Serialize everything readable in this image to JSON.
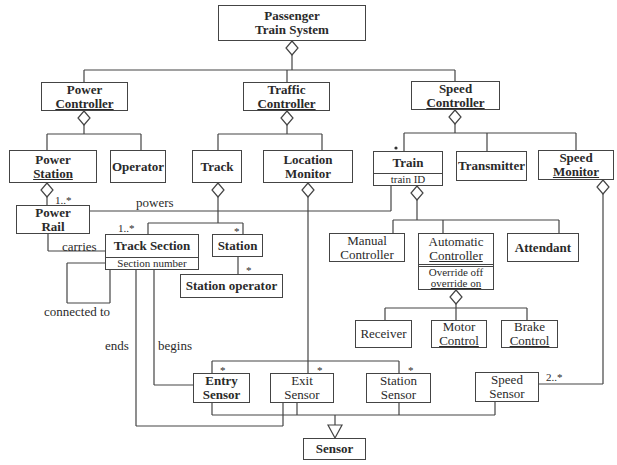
{
  "diagram": {
    "type": "UML class diagram",
    "classes": {
      "passenger_train_system": {
        "line1": "Passenger",
        "line2": "Train System"
      },
      "power_controller": {
        "line1": "Power",
        "line2": "Controller"
      },
      "traffic_controller": {
        "line1": "Traffic",
        "line2": "Controller"
      },
      "speed_controller": {
        "line1": "Speed",
        "line2": "Controller"
      },
      "power_station": {
        "line1": "Power",
        "line2": "Station"
      },
      "operator": {
        "name": "Operator"
      },
      "track": {
        "name": "Track"
      },
      "location_monitor": {
        "line1": "Location",
        "line2": "Monitor"
      },
      "train": {
        "name": "Train",
        "attribute": "train ID"
      },
      "transmitter": {
        "name": "Transmitter"
      },
      "speed_monitor": {
        "line1": "Speed",
        "line2": "Monitor"
      },
      "power_rail": {
        "line1": "Power",
        "line2": "Rail"
      },
      "track_section": {
        "name": "Track Section",
        "attribute": "Section number"
      },
      "station": {
        "name": "Station"
      },
      "station_operator": {
        "name": "Station operator"
      },
      "manual_controller": {
        "line1": "Manual",
        "line2": "Controller"
      },
      "automatic_controller": {
        "line1": "Automatic",
        "line2": "Controller",
        "attr1": "Override off",
        "attr2": "override on"
      },
      "attendant": {
        "name": "Attendant"
      },
      "receiver": {
        "name": "Receiver"
      },
      "motor_control": {
        "line1": "Motor",
        "line2": "Control"
      },
      "brake_control": {
        "line1": "Brake",
        "line2": "Control"
      },
      "entry_sensor": {
        "line1": "Entry",
        "line2": "Sensor"
      },
      "exit_sensor": {
        "line1": "Exit",
        "line2": "Sensor"
      },
      "station_sensor": {
        "line1": "Station",
        "line2": "Sensor"
      },
      "speed_sensor": {
        "line1": "Speed",
        "line2": "Sensor"
      },
      "sensor": {
        "name": "Sensor"
      }
    },
    "association_labels": {
      "powers": "powers",
      "carries": "carries",
      "connected_to": "connected to",
      "ends": "ends",
      "begins": "begins"
    },
    "multiplicities": {
      "power_rail": "1..*",
      "track_section": "1..*",
      "station": "*",
      "station_operator": "*",
      "train": "*",
      "entry_sensor": "*",
      "exit_sensor": "*",
      "station_sensor": "*",
      "speed_sensor": "2..*"
    },
    "colors": {
      "line": "#444444",
      "text": "#2a2a2a",
      "background": "#ffffff"
    }
  }
}
